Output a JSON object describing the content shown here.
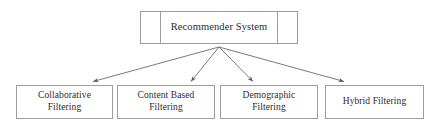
{
  "diagram": {
    "type": "hierarchy-tree",
    "orientation": "top-down",
    "colors": {
      "background": "#ffffff",
      "box_border": "#9c9c9c",
      "box_fill": "#ffffff",
      "text": "#2b2b2b",
      "edge": "#6b6b6b"
    },
    "root": {
      "label": "Recommender System",
      "cells": [
        "",
        "Recommender System",
        ""
      ]
    },
    "children": [
      {
        "label": "Collaborative\nFiltering"
      },
      {
        "label": "Content Based\nFiltering"
      },
      {
        "label": "Demographic\nFiltering"
      },
      {
        "label": "Hybrid Filtering"
      }
    ],
    "edges": [
      {
        "from": "root",
        "to": "Collaborative Filtering",
        "arrow": "to"
      },
      {
        "from": "root",
        "to": "Content Based Filtering",
        "arrow": "to"
      },
      {
        "from": "root",
        "to": "Demographic Filtering",
        "arrow": "to"
      },
      {
        "from": "root",
        "to": "Hybrid Filtering",
        "arrow": "to"
      }
    ]
  }
}
